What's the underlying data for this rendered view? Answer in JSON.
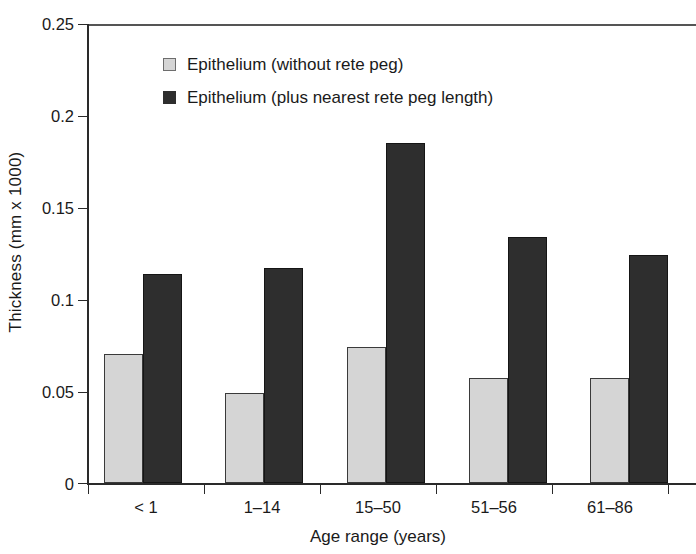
{
  "chart_data": {
    "type": "bar",
    "title": "",
    "xlabel": "Age range (years)",
    "ylabel": "Thickness (mm x 1000)",
    "categories": [
      "< 1",
      "1–14",
      "15–50",
      "51–56",
      "61–86"
    ],
    "series": [
      {
        "name": "Epithelium (without rete peg)",
        "color": "#d5d5d5",
        "values": [
          0.07,
          0.049,
          0.074,
          0.057,
          0.057
        ]
      },
      {
        "name": "Epithelium (plus nearest rete peg length)",
        "color": "#2e2e2e",
        "values": [
          0.114,
          0.117,
          0.185,
          0.134,
          0.124
        ]
      }
    ],
    "ylim": [
      0,
      0.25
    ],
    "yticks": [
      0,
      0.05,
      0.1,
      0.15,
      0.2,
      0.25
    ],
    "ytick_labels": [
      "0",
      "0.05",
      "0.1",
      "0.15",
      "0.2",
      "0.25"
    ],
    "grid": false,
    "legend_position": "top-center"
  },
  "legend": {
    "items": [
      {
        "label": "Epithelium (without rete peg)",
        "swatch": "light-square-icon"
      },
      {
        "label": "Epithelium (plus nearest rete peg length)",
        "swatch": "dark-square-icon"
      }
    ]
  }
}
